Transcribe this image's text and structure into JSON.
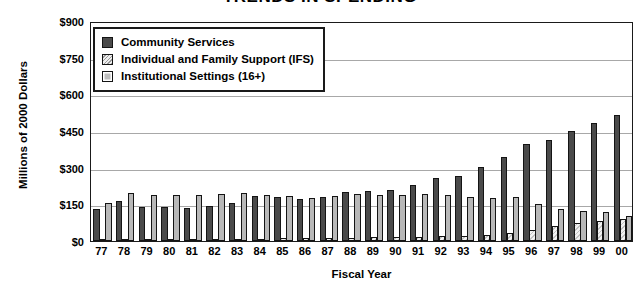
{
  "chart_data": {
    "type": "bar",
    "title": "TRENDS IN SPENDING",
    "xlabel": "Fiscal Year",
    "ylabel": "Millions of 2000 Dollars",
    "ylim": [
      0,
      900
    ],
    "yticks": [
      0,
      150,
      300,
      450,
      600,
      750,
      900
    ],
    "ytick_labels": [
      "$0",
      "$150",
      "$300",
      "$450",
      "$600",
      "$750",
      "$900"
    ],
    "grid": true,
    "legend_position": "upper left",
    "categories": [
      "77",
      "78",
      "79",
      "80",
      "81",
      "82",
      "83",
      "84",
      "85",
      "86",
      "87",
      "88",
      "89",
      "90",
      "91",
      "92",
      "93",
      "94",
      "95",
      "96",
      "97",
      "98",
      "99",
      "00"
    ],
    "series": [
      {
        "name": "Community Services",
        "color": "#4a4a4a",
        "pattern": "solid",
        "values": [
          130,
          165,
          140,
          140,
          135,
          145,
          155,
          185,
          180,
          172,
          180,
          200,
          205,
          210,
          230,
          258,
          268,
          302,
          345,
          395,
          412,
          452,
          482,
          515
        ]
      },
      {
        "name": "Individual and Family Support (IFS)",
        "color": "#d0d0d0",
        "pattern": "diagonal-hatch",
        "values": [
          8,
          8,
          8,
          8,
          9,
          9,
          10,
          10,
          11,
          12,
          12,
          14,
          15,
          16,
          18,
          20,
          22,
          26,
          32,
          45,
          60,
          72,
          80,
          92
        ]
      },
      {
        "name": "Institutional Settings (16+)",
        "color": "#b8b8b8",
        "pattern": "solid",
        "values": [
          155,
          195,
          190,
          188,
          190,
          192,
          195,
          190,
          185,
          178,
          185,
          192,
          190,
          190,
          192,
          188,
          182,
          178,
          180,
          150,
          130,
          122,
          120,
          102
        ]
      }
    ]
  },
  "legend": {
    "items": [
      {
        "label": "Community Services",
        "swatch": "community"
      },
      {
        "label": "Individual and Family Support (IFS)",
        "swatch": "ifs"
      },
      {
        "label": "Institutional Settings (16+)",
        "swatch": "institutional"
      }
    ]
  }
}
